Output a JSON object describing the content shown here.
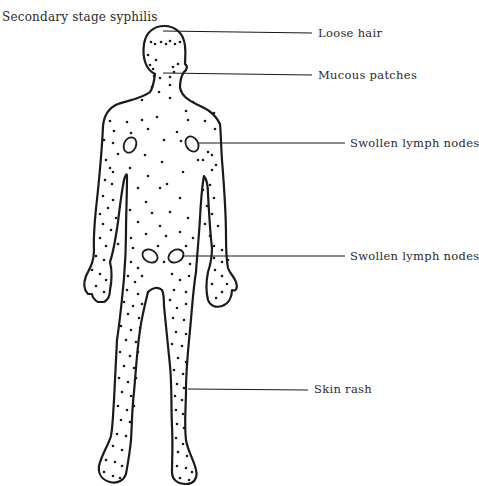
{
  "title": "Secondary stage syphilis",
  "labels": [
    {
      "id": "loose-hair",
      "text": "Loose hair"
    },
    {
      "id": "mucous-patches",
      "text": "Mucous patches"
    },
    {
      "id": "swollen-lymph-nodes-axillary",
      "text": "Swollen lymph nodes"
    },
    {
      "id": "swollen-lymph-nodes-inguinal",
      "text": "Swollen lymph nodes"
    },
    {
      "id": "skin-rash",
      "text": "Skin rash"
    }
  ],
  "colors": {
    "line": "#1a1a1a",
    "text": "#2a2a2a",
    "background": "#ffffff"
  }
}
